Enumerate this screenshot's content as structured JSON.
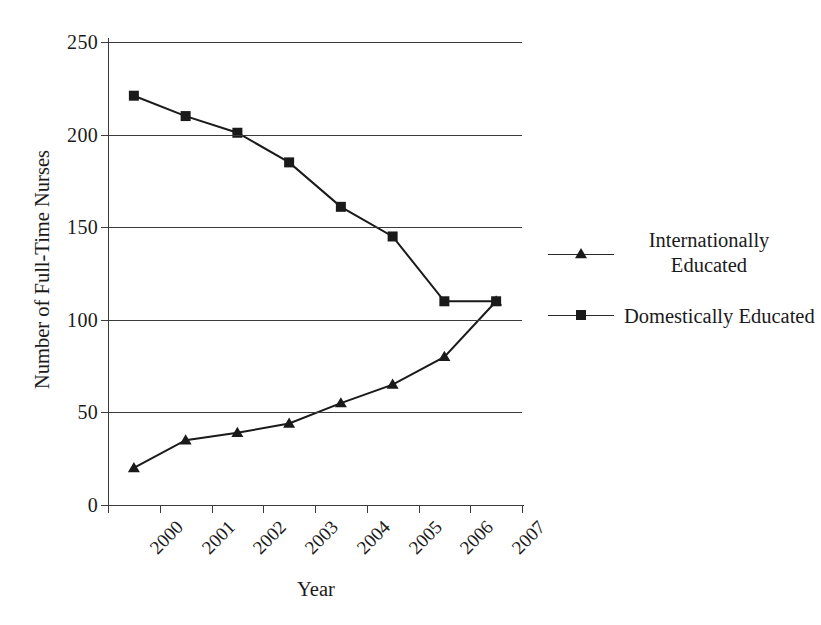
{
  "chart_data": {
    "type": "line",
    "title": "",
    "xlabel": "Year",
    "ylabel": "Number of Full-Time Nurses",
    "categories": [
      "2000",
      "2001",
      "2002",
      "2003",
      "2004",
      "2005",
      "2006",
      "2007"
    ],
    "ylim": [
      0,
      250
    ],
    "yticks": [
      0,
      50,
      100,
      150,
      200,
      250
    ],
    "ytick_labels": [
      "0",
      "50",
      "100",
      "150",
      "200",
      "250"
    ],
    "grid": "horizontal",
    "legend_position": "right",
    "series": [
      {
        "name": "Internationally Educated",
        "legend_label": "Internationally\nEducated",
        "marker": "triangle",
        "color": "#1a1a1a",
        "values": [
          20,
          35,
          39,
          44,
          55,
          65,
          80,
          110
        ]
      },
      {
        "name": "Domestically Educated",
        "legend_label": "Domestically Educated",
        "marker": "square",
        "color": "#1a1a1a",
        "values": [
          221,
          210,
          201,
          185,
          161,
          145,
          110,
          110
        ]
      }
    ]
  },
  "axes": {
    "y_title": "Number of Full-Time Nurses",
    "x_title": "Year"
  },
  "legend": {
    "items": [
      {
        "label": "Internationally\nEducated",
        "marker": "triangle"
      },
      {
        "label": "Domestically Educated",
        "marker": "square"
      }
    ]
  },
  "colors": {
    "ink": "#1a1a1a",
    "axis": "#3a3a3a",
    "background": "#ffffff"
  }
}
